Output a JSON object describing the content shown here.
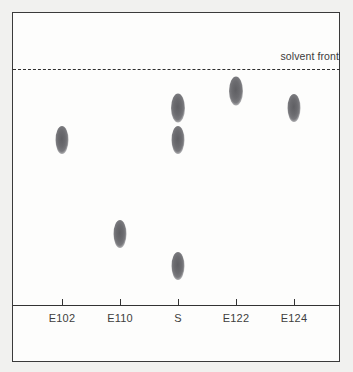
{
  "figure": {
    "name": "tlc-plate",
    "background_color": "#f1f1ef",
    "plate_color": "#fdfdfc",
    "border_color": "#3a3a3a"
  },
  "solvent_front": {
    "label": "solvent front",
    "line_style": "dashed",
    "line_color": "#2e2e2e"
  },
  "axis": {
    "baseline_color": "#333333",
    "lanes": [
      {
        "label": "E102"
      },
      {
        "label": "E110"
      },
      {
        "label": "S"
      },
      {
        "label": "E122"
      },
      {
        "label": "E124"
      }
    ]
  },
  "spot_color": "#6b6b6f",
  "chart_data": {
    "type": "scatter",
    "title": "",
    "subtitle": "",
    "xlabel": "",
    "ylabel": "",
    "grid": false,
    "legend": "none",
    "annotations": [
      "solvent front"
    ],
    "x": [
      "E102",
      "E110",
      "S",
      "E122",
      "E124"
    ],
    "categories": [
      "E102",
      "E110",
      "S",
      "E122",
      "E124"
    ],
    "baseline_y_px": 305,
    "solvent_front_y_px": 69,
    "ylim": [
      0,
      1
    ],
    "tick_x_px": [
      62,
      120,
      178,
      236,
      294
    ],
    "series": [
      {
        "name": "E102",
        "lane_x_px": 62,
        "spots": [
          {
            "y_px": 140,
            "rf": 0.7,
            "width_px": 13,
            "height_px": 28
          }
        ]
      },
      {
        "name": "E110",
        "lane_x_px": 120,
        "spots": [
          {
            "y_px": 234,
            "rf": 0.3,
            "width_px": 13,
            "height_px": 28
          }
        ]
      },
      {
        "name": "S",
        "lane_x_px": 178,
        "spots": [
          {
            "y_px": 108,
            "rf": 0.84,
            "width_px": 14,
            "height_px": 29
          },
          {
            "y_px": 140,
            "rf": 0.7,
            "width_px": 13,
            "height_px": 28
          },
          {
            "y_px": 266,
            "rf": 0.17,
            "width_px": 13,
            "height_px": 28
          }
        ]
      },
      {
        "name": "E122",
        "lane_x_px": 236,
        "spots": [
          {
            "y_px": 91,
            "rf": 0.91,
            "width_px": 14,
            "height_px": 29
          }
        ]
      },
      {
        "name": "E124",
        "lane_x_px": 294,
        "spots": [
          {
            "y_px": 108,
            "rf": 0.84,
            "width_px": 13,
            "height_px": 28
          }
        ]
      }
    ]
  }
}
